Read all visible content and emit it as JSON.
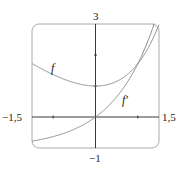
{
  "chart_data": {
    "type": "line",
    "title": "",
    "xlabel": "",
    "ylabel": "",
    "xlim": [
      -1.5,
      1.5
    ],
    "ylim": [
      -1,
      3
    ],
    "grid": false,
    "tick_labels": {
      "x_min": "−1,5",
      "x_max": "1,5",
      "y_max": "3",
      "y_min": "−1"
    },
    "x_ticks": [
      -1,
      1
    ],
    "y_ticks": [
      1,
      2
    ],
    "series": [
      {
        "name": "f",
        "formula": "e^x - x",
        "x": [
          -1.5,
          -1,
          -0.5,
          0,
          0.5,
          1,
          1.5
        ],
        "values": [
          1.72,
          1.37,
          1.11,
          1.0,
          1.15,
          1.72,
          2.98
        ]
      },
      {
        "name": "f′",
        "formula": "e^x - 1",
        "x": [
          -1.5,
          -1,
          -0.5,
          0,
          0.5,
          1,
          1.5
        ],
        "values": [
          -0.78,
          -0.63,
          -0.39,
          0.0,
          0.65,
          1.72,
          3.48
        ]
      }
    ],
    "annotations": [
      {
        "text": "f",
        "x": -0.95,
        "y": 1.95
      },
      {
        "text": "f′",
        "x": 0.55,
        "y": 0.9
      }
    ]
  },
  "labels": {
    "x_min": "−1,5",
    "x_max": "1,5",
    "y_max": "3",
    "y_min": "−1",
    "f": "f",
    "fprime": "f′"
  }
}
